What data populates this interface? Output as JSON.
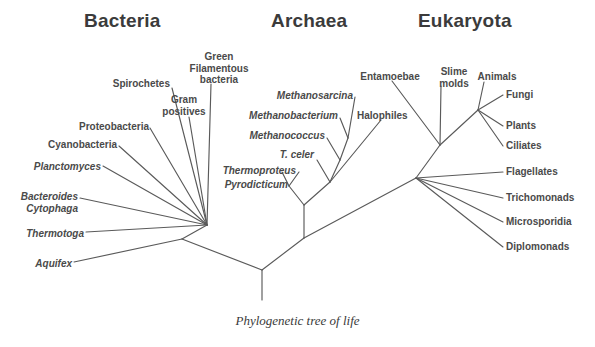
{
  "figure": {
    "caption": "Phylogenetic tree of life",
    "background_color": "#ffffff",
    "line_color": "#5a5a5a",
    "text_color": "#4a4a4a",
    "width": 595,
    "height": 347
  },
  "headings": [
    {
      "label": "Bacteria",
      "x": 130,
      "y": 10
    },
    {
      "label": "Archaea",
      "x": 311,
      "y": 10
    },
    {
      "label": "Eukaryota",
      "x": 465,
      "y": 10
    }
  ],
  "domains": {
    "bacteria": {
      "heading": "Bacteria",
      "taxa": [
        {
          "label": "Spirochetes",
          "italic": false,
          "align": "right",
          "x": 90,
          "y": 78
        },
        {
          "label": "Green\nFilamentous\nbacteria",
          "italic": false,
          "align": "center",
          "x": 180,
          "y": 51
        },
        {
          "label": "Gram\npositives",
          "italic": false,
          "align": "center",
          "x": 166,
          "y": 94
        },
        {
          "label": "Proteobacteria",
          "italic": false,
          "align": "right",
          "x": 69,
          "y": 121
        },
        {
          "label": "Cyanobacteria",
          "italic": false,
          "align": "right",
          "x": 25,
          "y": 139
        },
        {
          "label": "Planctomyces",
          "italic": true,
          "align": "right",
          "x": 23,
          "y": 161
        },
        {
          "label": "Bacteroides\nCytophaga",
          "italic": true,
          "align": "right",
          "x": 18,
          "y": 191
        },
        {
          "label": "Thermotoga",
          "italic": true,
          "align": "right",
          "x": 18,
          "y": 229
        },
        {
          "label": "Aquifex",
          "italic": true,
          "align": "right",
          "x": 18,
          "y": 258
        }
      ]
    },
    "archaea": {
      "heading": "Archaea",
      "taxa": [
        {
          "label": "Methanosarcina",
          "italic": true,
          "align": "right",
          "x": 273,
          "y": 90
        },
        {
          "label": "Methanobacterium",
          "italic": true,
          "align": "right",
          "x": 231,
          "y": 111
        },
        {
          "label": "Methanococcus",
          "italic": true,
          "align": "right",
          "x": 238,
          "y": 131
        },
        {
          "label": "T. celer",
          "italic": true,
          "align": "right",
          "x": 271,
          "y": 150
        },
        {
          "label": "Thermoproteus",
          "italic": true,
          "align": "right",
          "x": 221,
          "y": 166
        },
        {
          "label": "Pyrodicticum",
          "italic": true,
          "align": "right",
          "x": 214,
          "y": 180
        },
        {
          "label": "Halophiles",
          "italic": false,
          "align": "left",
          "x": 357,
          "y": 110
        }
      ]
    },
    "eukaryota": {
      "heading": "Eukaryota",
      "taxa": [
        {
          "label": "Entamoebae",
          "italic": false,
          "align": "center",
          "x": 357,
          "y": 71
        },
        {
          "label": "Slime\nmolds",
          "italic": false,
          "align": "center",
          "x": 437,
          "y": 66
        },
        {
          "label": "Animals",
          "italic": false,
          "align": "center",
          "x": 473,
          "y": 71
        },
        {
          "label": "Fungi",
          "italic": false,
          "align": "left",
          "x": 506,
          "y": 92
        },
        {
          "label": "Plants",
          "italic": false,
          "align": "left",
          "x": 506,
          "y": 122
        },
        {
          "label": "Ciliates",
          "italic": false,
          "align": "left",
          "x": 506,
          "y": 142
        },
        {
          "label": "Flagellates",
          "italic": false,
          "align": "left",
          "x": 506,
          "y": 168
        },
        {
          "label": "Trichomonads",
          "italic": false,
          "align": "left",
          "x": 506,
          "y": 194
        },
        {
          "label": "Microsporidia",
          "italic": false,
          "align": "left",
          "x": 506,
          "y": 218
        },
        {
          "label": "Diplomonads",
          "italic": false,
          "align": "left",
          "x": 506,
          "y": 243
        }
      ]
    }
  },
  "tree_structure": {
    "root_stem": {
      "x1": 262,
      "y1": 270,
      "x2": 262,
      "y2": 300
    },
    "nodes": {
      "root": {
        "x": 262,
        "y": 270
      },
      "bacteria_fan": {
        "x": 207,
        "y": 225
      },
      "bacteria_basal": {
        "x": 182,
        "y": 239
      },
      "archaea_base": {
        "x": 304,
        "y": 238
      },
      "archaea_fan": {
        "x": 304,
        "y": 205
      },
      "archaea_upper": {
        "x": 330,
        "y": 182
      },
      "eukaryota_base": {
        "x": 416,
        "y": 178
      },
      "eukaryota_mid": {
        "x": 440,
        "y": 145
      },
      "eukaryota_crown": {
        "x": 478,
        "y": 110
      }
    }
  }
}
